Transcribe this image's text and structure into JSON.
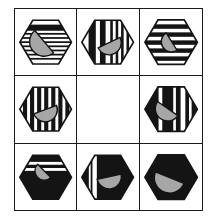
{
  "figure": {
    "type": "matrix-puzzle-3x3",
    "grid": {
      "rows": 3,
      "cols": 3,
      "left": 14,
      "top": 8,
      "width": 189,
      "height": 203,
      "line_color": "#1a1a1a"
    },
    "colors": {
      "page_bg": "#ffffff",
      "hex_white": "#ffffff",
      "hex_black": "#141414",
      "moon_fill": "#a6a6a6",
      "outline": "#141414"
    },
    "hex_bounds": {
      "x0": 5,
      "y0": 11,
      "w": 53,
      "h": 45
    },
    "viewbox": {
      "w": 63,
      "h": 67
    },
    "cells": [
      {
        "id": "r1c1",
        "empty": false,
        "bg": "#ffffff",
        "stripes": {
          "dir": "h",
          "color": "#141414",
          "bars": [
            [
              0.1,
              0.14
            ],
            [
              0.29,
              0.04
            ],
            [
              0.385,
              0.04
            ],
            [
              0.48,
              0.04
            ],
            [
              0.575,
              0.04
            ],
            [
              0.67,
              0.04
            ],
            [
              0.765,
              0.04
            ],
            [
              0.86,
              0.04
            ]
          ]
        },
        "moon": {
          "cx": 30,
          "cy": 33,
          "r": 15,
          "rot": 50
        }
      },
      {
        "id": "r1c2",
        "empty": false,
        "bg": "#ffffff",
        "stripes": {
          "dir": "v",
          "color": "#141414",
          "bars": [
            [
              0.13,
              0.14
            ],
            [
              0.35,
              0.11
            ],
            [
              0.55,
              0.05
            ],
            [
              0.655,
              0.05
            ],
            [
              0.76,
              0.05
            ],
            [
              0.865,
              0.05
            ]
          ]
        },
        "moon": {
          "cx": 33,
          "cy": 34,
          "r": 12.5,
          "rot": -25
        }
      },
      {
        "id": "r1c3",
        "empty": false,
        "bg": "#ffffff",
        "stripes": {
          "dir": "h",
          "color": "#141414",
          "bars": [
            [
              0.1,
              0.1
            ],
            [
              0.28,
              0.1
            ],
            [
              0.46,
              0.1
            ],
            [
              0.64,
              0.1
            ],
            [
              0.82,
              0.1
            ]
          ]
        },
        "moon": {
          "cx": 32,
          "cy": 33,
          "r": 10.5,
          "rot": 58
        }
      },
      {
        "id": "r2c1",
        "empty": false,
        "bg": "#ffffff",
        "stripes": {
          "dir": "v",
          "color": "#141414",
          "bars": [
            [
              0.06,
              0.08
            ],
            [
              0.197,
              0.08
            ],
            [
              0.334,
              0.08
            ],
            [
              0.471,
              0.08
            ],
            [
              0.608,
              0.08
            ],
            [
              0.745,
              0.08
            ],
            [
              0.882,
              0.08
            ]
          ]
        },
        "moon": {
          "cx": 31,
          "cy": 34,
          "r": 12.5,
          "rot": -20
        }
      },
      {
        "id": "r2c2",
        "empty": true
      },
      {
        "id": "r2c3",
        "empty": false,
        "bg": "#141414",
        "stripes": {
          "dir": "v",
          "color": "#ffffff",
          "bars": [
            [
              0.26,
              0.07
            ],
            [
              0.54,
              0.05
            ],
            [
              0.68,
              0.09
            ],
            [
              0.84,
              0.05
            ]
          ]
        },
        "moon": {
          "cx": 28,
          "cy": 33,
          "r": 12.5,
          "rot": 35
        }
      },
      {
        "id": "r3c1",
        "empty": false,
        "bg": "#141414",
        "stripes": {
          "dir": "h",
          "color": "#ffffff",
          "bars": [
            [
              0.15,
              0.065
            ],
            [
              0.29,
              0.065
            ]
          ]
        },
        "moon": {
          "cx": 30,
          "cy": 27,
          "r": 9.5,
          "rot": 45
        }
      },
      {
        "id": "r3c2",
        "empty": false,
        "bg": "#141414",
        "stripes": {
          "dir": "v",
          "color": "#ffffff",
          "bars": [
            [
              0.135,
              0.035
            ],
            [
              0.205,
              0.085
            ]
          ]
        },
        "moon": {
          "cx": 33,
          "cy": 33,
          "r": 12.5,
          "rot": -12
        }
      },
      {
        "id": "r3c3",
        "empty": false,
        "bg": "#141414",
        "stripes": null,
        "moon": {
          "cx": 30,
          "cy": 34,
          "r": 15.5,
          "rot": 22
        }
      }
    ]
  }
}
